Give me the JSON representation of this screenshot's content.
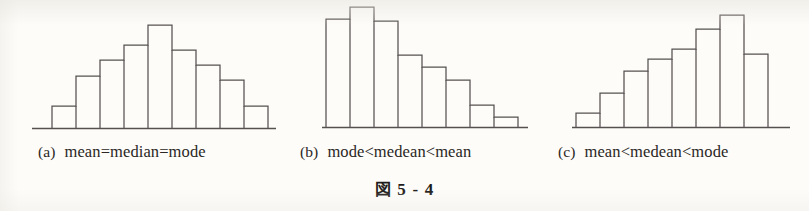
{
  "figure": {
    "number_kanji": "図",
    "number_text": "5 - 4",
    "background_color": "#fdfcf9",
    "ink_color": "#555150"
  },
  "panels": [
    {
      "label": "(a)",
      "expression": "mean=median=mode",
      "expr_parts": [
        "mean",
        "=",
        "median",
        "=",
        "mode"
      ],
      "caption_left": 38,
      "caption_label_left": 38,
      "chart_left": 26,
      "chart_width": 250,
      "chart_height": 136
    },
    {
      "label": "(b)",
      "expression": "mode<medean<mean",
      "expr_parts": [
        "mode",
        "<",
        "medean",
        "<",
        "mean"
      ],
      "caption_left": 300,
      "caption_label_left": 300,
      "chart_left": 300,
      "chart_width": 240,
      "chart_height": 136
    },
    {
      "label": "(c)",
      "expression": "mean<medean<mode",
      "expr_parts": [
        "mean",
        "<",
        "medean",
        "<",
        "mode"
      ],
      "caption_left": 558,
      "caption_label_left": 558,
      "chart_left": 558,
      "chart_width": 244,
      "chart_height": 136
    }
  ],
  "chart_data": [
    {
      "type": "bar",
      "title": "(a) mean=median=mode",
      "subtitle": "symmetric distribution",
      "categories": [
        "1",
        "2",
        "3",
        "4",
        "5",
        "6",
        "7",
        "8",
        "9"
      ],
      "values": [
        22,
        52,
        68,
        83,
        103,
        78,
        63,
        48,
        22
      ],
      "ylim": [
        0,
        110
      ],
      "xlabel": "",
      "ylabel": "",
      "grid": false,
      "legend": "none",
      "bar_fill": "none",
      "bar_stroke": "#555150",
      "axis_baseline": true,
      "geometry": {
        "baseline_y": 128,
        "axis_x_start": 32,
        "axis_x_end": 276,
        "bar_left_x": 52,
        "bar_width": 24,
        "bar_count": 9
      }
    },
    {
      "type": "bar",
      "title": "(b) mode<medean<mean",
      "subtitle": "right-skewed (positively skewed) distribution",
      "categories": [
        "1",
        "2",
        "3",
        "4",
        "5",
        "6",
        "7",
        "8"
      ],
      "values": [
        108,
        120,
        106,
        72,
        60,
        47,
        22,
        10
      ],
      "ylim": [
        0,
        128
      ],
      "xlabel": "",
      "ylabel": "",
      "grid": false,
      "legend": "none",
      "bar_fill": "none",
      "bar_stroke": "#555150",
      "axis_baseline": true,
      "geometry": {
        "baseline_y": 127,
        "axis_x_start": 322,
        "axis_x_end": 528,
        "bar_left_x": 326,
        "bar_width": 24,
        "bar_count": 8
      }
    },
    {
      "type": "bar",
      "title": "(c) mean<medean<mode",
      "subtitle": "left-skewed (negatively skewed) distribution",
      "categories": [
        "1",
        "2",
        "3",
        "4",
        "5",
        "6",
        "7",
        "8"
      ],
      "values": [
        14,
        34,
        56,
        68,
        78,
        98,
        112,
        73
      ],
      "ylim": [
        0,
        128
      ],
      "xlabel": "",
      "ylabel": "",
      "grid": false,
      "legend": "none",
      "bar_fill": "none",
      "bar_stroke": "#555150",
      "axis_baseline": true,
      "geometry": {
        "baseline_y": 127,
        "axis_x_start": 572,
        "axis_x_end": 790,
        "bar_left_x": 576,
        "bar_width": 24,
        "bar_count": 8
      }
    }
  ]
}
